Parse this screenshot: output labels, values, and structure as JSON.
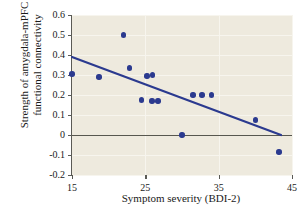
{
  "chart_data": {
    "type": "scatter",
    "title": "",
    "xlabel": "Symptom severity (BDI-2)",
    "ylabel": "Strength of amygdala-mPFC functional connectivity",
    "xlim": [
      15,
      45
    ],
    "ylim": [
      -0.2,
      0.6
    ],
    "xticks": [
      "15",
      "25",
      "35",
      "45"
    ],
    "yticks": [
      "0.6",
      "0.5",
      "0.4",
      "0.3",
      "0.2",
      "0.1",
      "0",
      "-0.1",
      "-0.2"
    ],
    "ytick_values": [
      0.6,
      0.5,
      0.4,
      0.3,
      0.2,
      0.1,
      0,
      -0.1,
      -0.2
    ],
    "xtick_values": [
      15,
      25,
      35,
      45
    ],
    "grid": true,
    "legend": "none",
    "zero_line": true,
    "point_color": "#2b3a8f",
    "trend_color": "#2b3a8f",
    "plot_background": "#eeeade",
    "points": [
      {
        "x": 15.0,
        "y": 0.305
      },
      {
        "x": 18.7,
        "y": 0.29
      },
      {
        "x": 22.0,
        "y": 0.5
      },
      {
        "x": 22.8,
        "y": 0.335
      },
      {
        "x": 24.5,
        "y": 0.175
      },
      {
        "x": 25.2,
        "y": 0.295
      },
      {
        "x": 26.0,
        "y": 0.3
      },
      {
        "x": 25.9,
        "y": 0.17
      },
      {
        "x": 26.7,
        "y": 0.17
      },
      {
        "x": 30.0,
        "y": 0.0
      },
      {
        "x": 31.5,
        "y": 0.2
      },
      {
        "x": 32.7,
        "y": 0.2
      },
      {
        "x": 34.0,
        "y": 0.2
      },
      {
        "x": 40.0,
        "y": 0.075
      },
      {
        "x": 43.2,
        "y": -0.085
      }
    ],
    "trend_line": {
      "x0": 15,
      "y0": 0.39,
      "x1": 43.5,
      "y1": 0.0
    }
  }
}
